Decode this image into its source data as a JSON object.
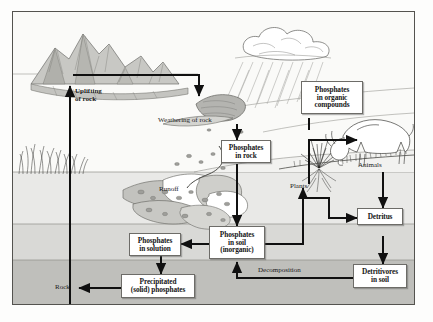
{
  "figure": {
    "type": "scientific-diagram",
    "border_color": "#54534f",
    "background": "#fafaf8"
  },
  "boxes": [
    {
      "id": "organic",
      "label": "Phosphates\nin organic\ncompounds",
      "lines": [
        "Phosphates",
        "in organic",
        "compounds"
      ]
    },
    {
      "id": "rock",
      "label": "Phosphates\nin rock",
      "lines": [
        "Phosphates",
        "in rock"
      ]
    },
    {
      "id": "soil",
      "label": "Phosphates\nin soil\n(inorganic)",
      "lines": [
        "Phosphates",
        "in soil",
        "(inorganic)"
      ]
    },
    {
      "id": "solution",
      "label": "Phosphates\nin solution",
      "lines": [
        "Phosphates",
        "in solution"
      ]
    },
    {
      "id": "precipitated",
      "label": "Precipitated\n(solid) phosphates",
      "lines": [
        "Precipitated",
        "(solid) phosphates"
      ]
    },
    {
      "id": "detritus",
      "label": "Detritus",
      "lines": [
        "Detritus"
      ]
    },
    {
      "id": "detritivores",
      "label": "Detritivores\nin soil",
      "lines": [
        "Detritivores",
        "in soil"
      ]
    }
  ],
  "labels": {
    "uplifting": "Uplifting\nof rock",
    "uplifting_line1": "Uplifting",
    "uplifting_line2": "of rock",
    "weathering": "Weathering of rock",
    "runoff": "Runoff",
    "plants": "Plants",
    "animals": "Animals",
    "decomposition": "Decomposition",
    "rock": "Rock"
  },
  "scene": {
    "mountains": "mountain-range",
    "cloud": "rain-cloud",
    "rain": "rain-streaks",
    "reeds": "shoreline-reeds",
    "grass_tuft": "plant-tuft",
    "deer": "grazing-animal",
    "sediment": "sediment-rocks",
    "water_layers": [
      "#e9e9e7",
      "#d9d9d6",
      "#bfbfbb"
    ]
  },
  "colors": {
    "arrow": "#101010",
    "box_border": "#6d6c68",
    "text": "#151515",
    "sky": "#fafaf8",
    "water_top": "#e9e9e7",
    "water_mid": "#d9d9d6",
    "water_bottom": "#bfbfbb",
    "rock_dark": "#9a9a95"
  }
}
